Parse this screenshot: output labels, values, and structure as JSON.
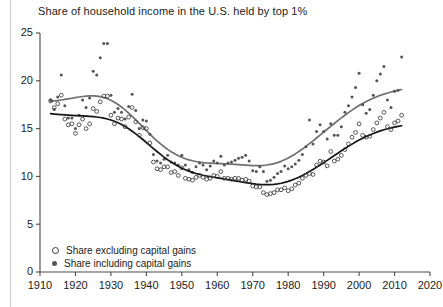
{
  "chart_data": {
    "type": "scatter",
    "title": "Share of household income in the U.S. held by top 1%",
    "xlabel": "",
    "ylabel": "",
    "xlim": [
      1910,
      2020
    ],
    "ylim": [
      0,
      25
    ],
    "xticks": [
      1910,
      1920,
      1930,
      1940,
      1950,
      1960,
      1970,
      1980,
      1990,
      2000,
      2010,
      2020
    ],
    "yticks": [
      0,
      5,
      10,
      15,
      20,
      25
    ],
    "grid": false,
    "legend_position": "bottom-left",
    "series": [
      {
        "name": "Share excluding capital gains",
        "marker": "open-circle",
        "color": "#3a3a3a",
        "trend_color": "#151515",
        "x": [
          1913,
          1914,
          1915,
          1916,
          1917,
          1918,
          1919,
          1920,
          1921,
          1922,
          1923,
          1924,
          1925,
          1926,
          1927,
          1928,
          1929,
          1930,
          1931,
          1932,
          1933,
          1934,
          1935,
          1936,
          1937,
          1938,
          1939,
          1940,
          1941,
          1942,
          1943,
          1944,
          1945,
          1946,
          1947,
          1948,
          1949,
          1950,
          1951,
          1952,
          1953,
          1954,
          1955,
          1956,
          1957,
          1958,
          1959,
          1960,
          1961,
          1962,
          1963,
          1964,
          1965,
          1966,
          1967,
          1968,
          1969,
          1970,
          1971,
          1972,
          1973,
          1974,
          1975,
          1976,
          1977,
          1978,
          1979,
          1980,
          1981,
          1982,
          1983,
          1984,
          1985,
          1986,
          1987,
          1988,
          1989,
          1990,
          1991,
          1992,
          1993,
          1994,
          1995,
          1996,
          1997,
          1998,
          1999,
          2000,
          2001,
          2002,
          2003,
          2004,
          2005,
          2006,
          2007,
          2008,
          2009,
          2010,
          2011,
          2012
        ],
        "y": [
          17.9,
          17.2,
          17.6,
          18.5,
          16.0,
          15.4,
          15.5,
          14.5,
          15.4,
          16.0,
          15.0,
          15.5,
          17.1,
          16.8,
          17.8,
          18.4,
          18.4,
          16.4,
          15.5,
          16.1,
          16.0,
          15.2,
          16.2,
          17.2,
          15.7,
          14.3,
          15.1,
          15.0,
          13.5,
          11.5,
          10.8,
          10.7,
          11.0,
          11.0,
          10.4,
          10.5,
          10.1,
          10.9,
          9.8,
          9.7,
          9.6,
          9.9,
          10.1,
          9.9,
          9.7,
          9.8,
          10.1,
          10.0,
          10.5,
          9.8,
          9.8,
          9.7,
          9.8,
          9.8,
          9.6,
          9.7,
          9.5,
          9.0,
          8.9,
          8.9,
          8.3,
          8.1,
          8.2,
          8.3,
          8.6,
          8.6,
          8.8,
          8.5,
          8.7,
          9.1,
          9.3,
          9.8,
          10.1,
          10.3,
          10.2,
          11.2,
          11.6,
          11.5,
          11.1,
          12.6,
          11.6,
          11.8,
          12.2,
          12.8,
          13.4,
          14.1,
          14.6,
          15.5,
          14.3,
          14.1,
          14.2,
          14.9,
          15.6,
          16.1,
          16.7,
          15.2,
          14.9,
          15.6,
          15.8,
          16.4
        ]
      },
      {
        "name": "Share including capital gains",
        "marker": "filled-circle",
        "color": "#555555",
        "trend_color": "#6f6f6f",
        "x": [
          1913,
          1914,
          1915,
          1916,
          1917,
          1918,
          1919,
          1920,
          1921,
          1922,
          1923,
          1924,
          1925,
          1926,
          1927,
          1928,
          1929,
          1930,
          1931,
          1932,
          1933,
          1934,
          1935,
          1936,
          1937,
          1938,
          1939,
          1940,
          1941,
          1942,
          1943,
          1944,
          1945,
          1946,
          1947,
          1948,
          1949,
          1950,
          1951,
          1952,
          1953,
          1954,
          1955,
          1956,
          1957,
          1958,
          1959,
          1960,
          1961,
          1962,
          1963,
          1964,
          1965,
          1966,
          1967,
          1968,
          1969,
          1970,
          1971,
          1972,
          1973,
          1974,
          1975,
          1976,
          1977,
          1978,
          1979,
          1980,
          1981,
          1982,
          1983,
          1984,
          1985,
          1986,
          1987,
          1988,
          1989,
          1990,
          1991,
          1992,
          1993,
          1994,
          1995,
          1996,
          1997,
          1998,
          1999,
          2000,
          2001,
          2002,
          2003,
          2004,
          2005,
          2006,
          2007,
          2008,
          2009,
          2010,
          2011,
          2012
        ],
        "y": [
          18.0,
          17.0,
          18.3,
          20.6,
          17.4,
          16.1,
          16.1,
          15.0,
          16.4,
          18.0,
          17.2,
          18.2,
          21.0,
          20.6,
          22.4,
          23.9,
          23.9,
          18.5,
          16.7,
          17.1,
          16.7,
          16.0,
          17.3,
          18.6,
          16.9,
          15.0,
          15.9,
          15.8,
          14.4,
          12.3,
          11.6,
          11.4,
          11.8,
          12.2,
          11.5,
          11.4,
          11.2,
          12.2,
          11.2,
          10.7,
          10.4,
          11.0,
          11.4,
          11.2,
          10.7,
          11.1,
          11.6,
          11.4,
          12.1,
          11.2,
          11.4,
          11.5,
          11.7,
          11.9,
          12.0,
          12.2,
          11.6,
          10.6,
          10.5,
          11.0,
          10.5,
          9.5,
          9.6,
          9.9,
          10.3,
          10.5,
          11.1,
          10.8,
          11.0,
          11.3,
          11.7,
          12.3,
          13.1,
          15.9,
          13.4,
          14.7,
          15.4,
          14.7,
          13.9,
          15.5,
          14.3,
          14.3,
          15.2,
          16.7,
          17.4,
          18.3,
          19.3,
          20.8,
          17.5,
          16.6,
          17.0,
          18.5,
          20.0,
          20.7,
          21.5,
          18.0,
          17.2,
          18.9,
          19.0,
          22.5
        ]
      }
    ]
  },
  "legend": {
    "entries": [
      {
        "label": "Share excluding capital gains",
        "marker": "open-circle"
      },
      {
        "label": "Share including capital gains",
        "marker": "filled-circle"
      }
    ]
  }
}
